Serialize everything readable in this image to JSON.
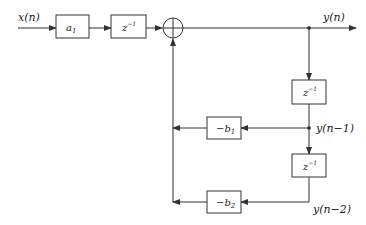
{
  "diagram": {
    "type": "signal-flow block diagram (second-order IIR, direct form)",
    "signals": {
      "input": "x(n)",
      "output": "y(n)",
      "delay1": "y(n−1)",
      "delay2": "y(n−2)"
    },
    "blocks": {
      "gain_a1": "a",
      "gain_a1_sub": "1",
      "delay_top": "z",
      "delay_sup": "−1",
      "delay_right1": "z",
      "delay_right2": "z",
      "feedback_b1": "−b",
      "feedback_b1_sub": "1",
      "feedback_b2": "−b",
      "feedback_b2_sub": "2"
    },
    "adder": "summation-node"
  }
}
